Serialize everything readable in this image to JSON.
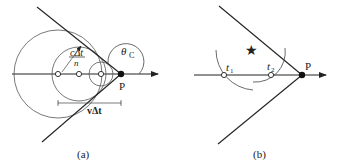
{
  "panel_a": {
    "caption": "(a)",
    "point_label": "P",
    "angle_label": "θ",
    "angle_sub": "C",
    "wavefront_label_num": "cΔt",
    "wavefront_label_den": "n",
    "displacement_label": "vΔt"
  },
  "panel_b": {
    "caption": "(b)",
    "point_label": "P",
    "t1_label": "t",
    "t1_sub": "1",
    "t2_label": "t",
    "t2_sub": "2",
    "star_icon": "★"
  }
}
